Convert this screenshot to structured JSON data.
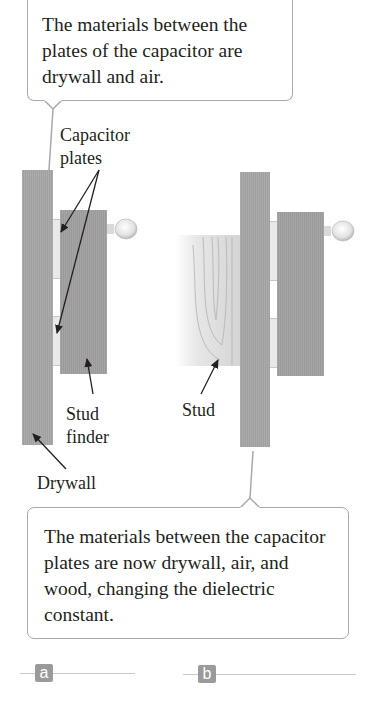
{
  "figure": {
    "panel_a": {
      "tag": "a",
      "callout_text": "The materials between the plates of the capacitor are drywall and air.",
      "labels": {
        "capacitor_plates": [
          "Capacitor",
          "plates"
        ],
        "stud_finder": [
          "Stud",
          "finder"
        ],
        "drywall": "Drywall"
      }
    },
    "panel_b": {
      "tag": "b",
      "callout_text": "The materials between the capacitor plates are now drywall, air, and wood, changing the dielectric constant.",
      "labels": {
        "stud": "Stud"
      }
    },
    "colors": {
      "board_gray": "#a6a6a6",
      "callout_border": "#a9a9a9",
      "tag_bg": "#9a9a9a",
      "text": "#231f20"
    }
  }
}
